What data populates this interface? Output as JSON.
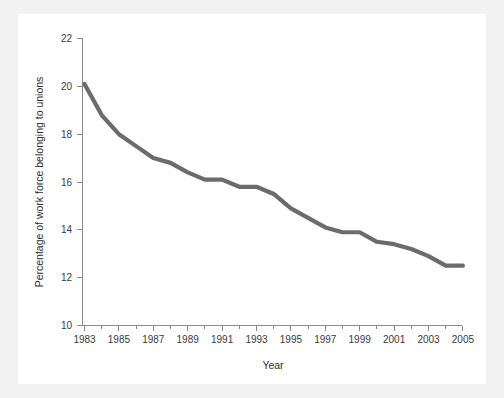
{
  "chart_data": {
    "type": "line",
    "title": "",
    "subtitle": "",
    "xlabel": "Year",
    "ylabel": "Percentage of work force belonging to unions",
    "xlim": [
      1983,
      2005
    ],
    "ylim": [
      10,
      22
    ],
    "grid": false,
    "legend": null,
    "legend_position": "none",
    "x_tick_labels": [
      "1983",
      "1985",
      "1987",
      "1989",
      "1991",
      "1993",
      "1995",
      "1997",
      "1999",
      "2001",
      "2003",
      "2005"
    ],
    "x_ticks": [
      1983,
      1985,
      1987,
      1989,
      1991,
      1993,
      1995,
      1997,
      1999,
      2001,
      2003,
      2005
    ],
    "x_minor_ticks": [
      1984,
      1986,
      1988,
      1990,
      1992,
      1994,
      1996,
      1998,
      2000,
      2002,
      2004
    ],
    "y_tick_labels": [
      "10",
      "12",
      "14",
      "16",
      "18",
      "20",
      "22"
    ],
    "y_ticks": [
      10,
      12,
      14,
      16,
      18,
      20,
      22
    ],
    "series": [
      {
        "name": "Percentage of work force belonging to unions",
        "color": "#6b6b6b",
        "x": [
          1983,
          1984,
          1985,
          1986,
          1987,
          1988,
          1989,
          1990,
          1991,
          1992,
          1993,
          1994,
          1995,
          1996,
          1997,
          1998,
          1999,
          2000,
          2001,
          2002,
          2003,
          2004,
          2005
        ],
        "values": [
          20.1,
          18.8,
          18.0,
          17.5,
          17.0,
          16.8,
          16.4,
          16.1,
          16.1,
          15.8,
          15.8,
          15.5,
          14.9,
          14.5,
          14.1,
          13.9,
          13.9,
          13.5,
          13.4,
          13.2,
          12.9,
          12.5,
          12.5
        ]
      }
    ]
  },
  "colors": {
    "page_background": "#f2f2f2",
    "panel_background": "#ffffff",
    "axis": "#8a8a8a",
    "line": "#6b6b6b",
    "text": "#2e2e2e"
  }
}
